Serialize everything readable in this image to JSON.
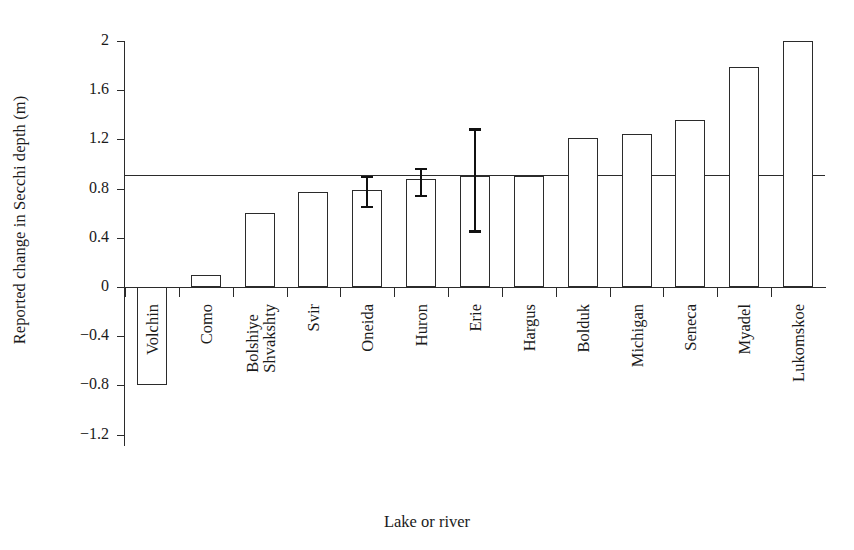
{
  "chart_data": {
    "type": "bar",
    "title": "",
    "xlabel": "Lake or river",
    "ylabel": "Reported change in Secchi depth (m)",
    "categories": [
      "Volchin",
      "Como",
      "Bolshiye Shvakshty",
      "Svir",
      "Oneida",
      "Huron",
      "Erie",
      "Hargus",
      "Bolduk",
      "Michigan",
      "Seneca",
      "Myadel",
      "Lukomskoe"
    ],
    "category_lines": [
      [
        "Volchin"
      ],
      [
        "Como"
      ],
      [
        "Bolshiye",
        "Shvakshty"
      ],
      [
        "Svir"
      ],
      [
        "Oneida"
      ],
      [
        "Huron"
      ],
      [
        "Erie"
      ],
      [
        "Hargus"
      ],
      [
        "Bolduk"
      ],
      [
        "Michigan"
      ],
      [
        "Seneca"
      ],
      [
        "Myadel"
      ],
      [
        "Lukomskoe"
      ]
    ],
    "values": [
      -0.8,
      0.1,
      0.6,
      0.77,
      0.79,
      0.88,
      0.9,
      0.9,
      1.21,
      1.24,
      1.36,
      1.79,
      2.0
    ],
    "error_bars": [
      null,
      null,
      null,
      null,
      {
        "low": 0.66,
        "high": 0.9
      },
      {
        "low": 0.75,
        "high": 0.97
      },
      {
        "low": 0.46,
        "high": 1.29
      },
      null,
      null,
      null,
      null,
      null,
      null
    ],
    "reference_line": 0.91,
    "ylim": [
      -1.2,
      2.0
    ],
    "yticks": [
      2,
      1.6,
      1.2,
      0.8,
      0.4,
      0,
      -0.4,
      -0.8,
      -1.2
    ],
    "ytick_labels": [
      "2",
      "1.6",
      "1.2",
      "0.8",
      "0.4",
      "0",
      "−0.4",
      "−0.8",
      "−1.2"
    ],
    "grid": false,
    "legend": null,
    "bar_fill": "#ffffff",
    "bar_stroke": "#2b2b2b",
    "errorbar_color": "#111111",
    "axis_color": "#2b2b2b"
  }
}
